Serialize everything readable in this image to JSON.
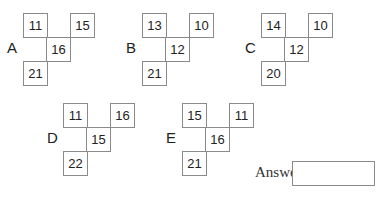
{
  "figures": [
    {
      "label": "A",
      "top_left": "11",
      "top_right": "15",
      "center": "16",
      "bottom_left": "21"
    },
    {
      "label": "B",
      "top_left": "13",
      "top_right": "10",
      "center": "12",
      "bottom_left": "21"
    },
    {
      "label": "C",
      "top_left": "14",
      "top_right": "10",
      "center": "12",
      "bottom_left": "20"
    },
    {
      "label": "D",
      "top_left": "11",
      "top_right": "16",
      "center": "15",
      "bottom_left": "22"
    },
    {
      "label": "E",
      "top_left": "15",
      "top_right": "11",
      "center": "16",
      "bottom_left": "21"
    }
  ],
  "answer": {
    "label": "Answer:",
    "value": ""
  }
}
